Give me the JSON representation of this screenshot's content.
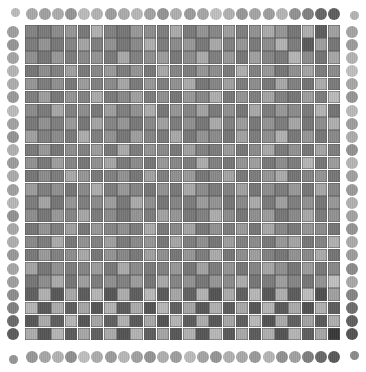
{
  "figure": {
    "type": "heatmap",
    "background_color": "#ffffff",
    "canvas": {
      "width": 366,
      "height": 372
    }
  },
  "grid": {
    "rows": 24,
    "cols": 24,
    "origin_x": 25,
    "origin_y": 25,
    "cell_width": 13.17,
    "cell_height": 13.17,
    "gap": 0.6,
    "gridline_color": "#5a5a5a",
    "texture": "fine-vertical-stripes"
  },
  "border_dots": {
    "count_per_side": 24,
    "radius": 6.0,
    "top_y": 14,
    "bottom_y": 357,
    "left_x": 13,
    "right_x": 352,
    "corner_radius": 4.5
  },
  "legend": {
    "scale_label": "grayscale intensity",
    "min_value": 0,
    "max_value": 255,
    "dark_label": "dark",
    "light_label": "light"
  },
  "chart_data": {
    "type": "heatmap",
    "subtitle": "",
    "xlabel": "",
    "ylabel": "",
    "grid": true,
    "legend_position": "none",
    "nrows": 24,
    "ncols": 24,
    "value_range": [
      56,
      215
    ],
    "colormap": "gray",
    "x": [
      0,
      1,
      2,
      3,
      4,
      5,
      6,
      7,
      8,
      9,
      10,
      11,
      12,
      13,
      14,
      15,
      16,
      17,
      18,
      19,
      20,
      21,
      22,
      23
    ],
    "y": [
      0,
      1,
      2,
      3,
      4,
      5,
      6,
      7,
      8,
      9,
      10,
      11,
      12,
      13,
      14,
      15,
      16,
      17,
      18,
      19,
      20,
      21,
      22,
      23
    ],
    "values": [
      [
        132,
        124,
        140,
        150,
        122,
        176,
        130,
        120,
        152,
        142,
        128,
        170,
        124,
        148,
        136,
        158,
        128,
        146,
        170,
        150,
        120,
        174,
        96,
        160
      ],
      [
        126,
        148,
        122,
        134,
        164,
        128,
        146,
        120,
        138,
        174,
        126,
        140,
        152,
        122,
        168,
        130,
        150,
        124,
        142,
        178,
        126,
        92,
        158,
        120
      ],
      [
        144,
        120,
        152,
        126,
        138,
        148,
        124,
        168,
        130,
        144,
        156,
        122,
        142,
        170,
        128,
        152,
        120,
        160,
        134,
        124,
        180,
        140,
        118,
        166
      ],
      [
        120,
        142,
        130,
        160,
        124,
        136,
        154,
        126,
        148,
        122,
        168,
        134,
        126,
        150,
        142,
        124,
        174,
        130,
        152,
        120,
        144,
        164,
        126,
        140
      ],
      [
        150,
        126,
        144,
        122,
        156,
        130,
        140,
        166,
        124,
        152,
        128,
        146,
        170,
        120,
        134,
        160,
        126,
        142,
        122,
        168,
        130,
        118,
        172,
        124
      ],
      [
        128,
        158,
        122,
        148,
        132,
        170,
        124,
        138,
        160,
        126,
        144,
        120,
        152,
        136,
        174,
        122,
        148,
        128,
        164,
        130,
        120,
        158,
        126,
        186
      ],
      [
        140,
        124,
        166,
        130,
        142,
        122,
        158,
        128,
        146,
        172,
        120,
        150,
        134,
        162,
        124,
        144,
        120,
        168,
        126,
        152,
        140,
        124,
        178,
        118
      ],
      [
        122,
        146,
        128,
        154,
        120,
        164,
        134,
        150,
        122,
        138,
        160,
        126,
        144,
        120,
        170,
        130,
        156,
        122,
        148,
        126,
        166,
        120,
        142,
        174
      ],
      [
        160,
        130,
        140,
        124,
        172,
        128,
        146,
        120,
        158,
        134,
        124,
        168,
        122,
        148,
        140,
        120,
        162,
        126,
        144,
        176,
        122,
        150,
        120,
        138
      ],
      [
        124,
        152,
        120,
        142,
        130,
        156,
        122,
        170,
        126,
        148,
        138,
        122,
        160,
        130,
        126,
        154,
        120,
        140,
        168,
        124,
        146,
        120,
        164,
        128
      ],
      [
        146,
        122,
        158,
        134,
        120,
        144,
        166,
        124,
        140,
        120,
        152,
        136,
        126,
        172,
        130,
        120,
        148,
        158,
        122,
        142,
        126,
        180,
        120,
        156
      ],
      [
        120,
        140,
        126,
        168,
        150,
        122,
        130,
        146,
        120,
        162,
        128,
        144,
        154,
        120,
        138,
        164,
        122,
        126,
        150,
        170,
        118,
        134,
        148,
        120
      ],
      [
        156,
        128,
        144,
        120,
        138,
        172,
        126,
        152,
        134,
        120,
        146,
        122,
        168,
        140,
        124,
        130,
        160,
        120,
        142,
        126,
        152,
        120,
        166,
        134
      ],
      [
        126,
        164,
        120,
        150,
        128,
        140,
        158,
        122,
        170,
        144,
        120,
        134,
        126,
        156,
        148,
        120,
        138,
        170,
        124,
        160,
        128,
        146,
        120,
        152
      ],
      [
        142,
        120,
        152,
        134,
        166,
        124,
        140,
        120,
        148,
        126,
        162,
        150,
        122,
        130,
        172,
        140,
        120,
        144,
        156,
        120,
        138,
        168,
        124,
        146
      ],
      [
        120,
        148,
        128,
        160,
        120,
        152,
        134,
        144,
        126,
        170,
        122,
        138,
        164,
        120,
        146,
        126,
        154,
        120,
        168,
        136,
        122,
        150,
        140,
        120
      ],
      [
        138,
        126,
        170,
        122,
        146,
        130,
        160,
        124,
        138,
        150,
        120,
        166,
        128,
        144,
        120,
        158,
        130,
        140,
        122,
        152,
        164,
        120,
        132,
        176
      ],
      [
        122,
        154,
        130,
        142,
        168,
        120,
        148,
        136,
        122,
        160,
        144,
        120,
        150,
        126,
        170,
        120,
        142,
        158,
        130,
        120,
        146,
        138,
        170,
        118
      ],
      [
        164,
        120,
        146,
        126,
        134,
        156,
        122,
        170,
        140,
        124,
        130,
        152,
        120,
        162,
        126,
        148,
        120,
        134,
        166,
        144,
        120,
        156,
        122,
        138
      ],
      [
        120,
        142,
        170,
        120,
        158,
        126,
        144,
        130,
        156,
        120,
        168,
        134,
        146,
        120,
        150,
        140,
        172,
        120,
        126,
        158,
        134,
        120,
        148,
        190
      ],
      [
        98,
        176,
        90,
        168,
        94,
        180,
        88,
        172,
        96,
        184,
        92,
        166,
        100,
        178,
        86,
        170,
        98,
        182,
        90,
        174,
        94,
        188,
        82,
        160
      ],
      [
        180,
        92,
        172,
        96,
        166,
        88,
        178,
        94,
        170,
        86,
        182,
        98,
        164,
        90,
        176,
        94,
        168,
        88,
        180,
        92,
        170,
        84,
        176,
        96
      ],
      [
        90,
        170,
        96,
        182,
        88,
        164,
        98,
        176,
        92,
        168,
        86,
        180,
        94,
        172,
        90,
        166,
        96,
        184,
        84,
        170,
        98,
        162,
        92,
        174
      ],
      [
        172,
        88,
        180,
        94,
        166,
        98,
        170,
        86,
        178,
        96,
        164,
        90,
        176,
        88,
        182,
        92,
        168,
        94,
        174,
        86,
        180,
        96,
        166,
        60
      ]
    ],
    "border_dot_values": {
      "top": [
        168,
        160,
        172,
        150,
        186,
        178,
        158,
        170,
        182,
        162,
        148,
        174,
        156,
        166,
        190,
        176,
        152,
        164,
        158,
        180,
        146,
        130,
        104,
        96
      ],
      "bottom": [
        152,
        166,
        178,
        144,
        190,
        172,
        156,
        182,
        160,
        148,
        174,
        158,
        186,
        164,
        150,
        176,
        168,
        154,
        180,
        146,
        160,
        128,
        106,
        92
      ],
      "left": [
        158,
        150,
        164,
        180,
        172,
        154,
        186,
        162,
        148,
        176,
        156,
        170,
        160,
        182,
        146,
        168,
        174,
        152,
        166,
        158,
        142,
        130,
        108,
        94
      ],
      "right": [
        164,
        156,
        178,
        190,
        166,
        150,
        184,
        158,
        172,
        146,
        180,
        160,
        154,
        176,
        162,
        148,
        170,
        156,
        140,
        168,
        134,
        112,
        98,
        86
      ]
    }
  }
}
